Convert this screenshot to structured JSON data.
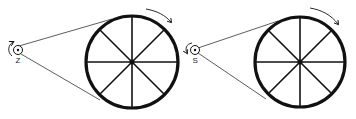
{
  "diagram": {
    "type": "belt-drive",
    "colors": {
      "stroke": "#111111",
      "belt": "#333333",
      "background": "#ffffff"
    },
    "panels": [
      {
        "id": "left",
        "pulley_label": "Z",
        "pulley_rotation": "clockwise-arrow-left",
        "wheel_rotation": "clockwise",
        "spokes": 8
      },
      {
        "id": "right",
        "pulley_label": "S",
        "pulley_rotation": "counterclockwise-arrow-left",
        "wheel_rotation": "clockwise",
        "spokes": 8
      }
    ]
  }
}
